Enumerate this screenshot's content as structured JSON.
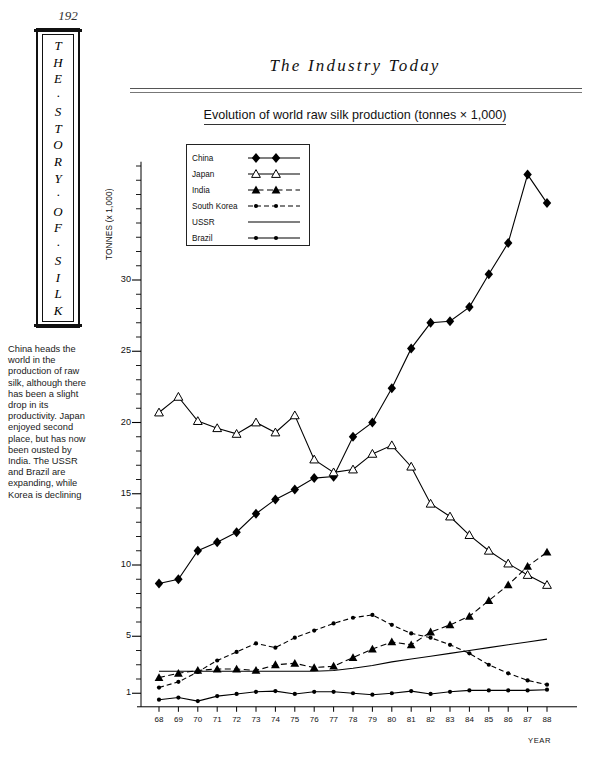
{
  "page": {
    "number": "192",
    "spine_letters": [
      "T",
      "H",
      "E",
      "·",
      "S",
      "T",
      "O",
      "R",
      "Y",
      "·",
      "O",
      "F",
      "·",
      "S",
      "I",
      "L",
      "K"
    ],
    "running_head": "The Industry Today",
    "caption": "China heads the world in the production of raw silk, although there has been a slight drop in its productivity. Japan enjoyed second place, but has now been ousted by India. The USSR and Brazil are expanding, while Korea is declining"
  },
  "chart_data": {
    "type": "line",
    "title": "Evolution of world raw silk production (tonnes × 1,000)",
    "xlabel": "YEAR",
    "ylabel": "TONNES (x 1,000)",
    "grid": false,
    "legend_position": "top-left-inside",
    "x": [
      "68",
      "69",
      "70",
      "71",
      "72",
      "73",
      "74",
      "75",
      "76",
      "77",
      "78",
      "79",
      "80",
      "81",
      "82",
      "83",
      "84",
      "85",
      "86",
      "87",
      "88"
    ],
    "xlim": [
      68,
      88
    ],
    "ylim": [
      0,
      38.5
    ],
    "yticks": [
      1,
      5,
      10,
      15,
      20,
      25,
      30
    ],
    "ytick_labels": [
      "1",
      "5",
      "10",
      "15",
      "20",
      "25",
      "30"
    ],
    "yminor_step": 1,
    "series": [
      {
        "name": "China",
        "marker": "filled-diamond",
        "line": "solid",
        "color": "#000000",
        "values": [
          8.7,
          9.0,
          11.0,
          11.6,
          12.3,
          13.6,
          14.6,
          15.3,
          16.1,
          16.2,
          19.0,
          20.0,
          22.4,
          25.2,
          27.0,
          27.1,
          28.1,
          30.4,
          32.6,
          37.4,
          35.4
        ]
      },
      {
        "name": "Japan",
        "marker": "open-triangle",
        "line": "solid",
        "color": "#000000",
        "values": [
          20.7,
          21.8,
          20.1,
          19.6,
          19.2,
          20.0,
          19.3,
          20.5,
          17.4,
          16.5,
          16.7,
          17.8,
          18.4,
          16.9,
          14.3,
          13.4,
          12.1,
          11.0,
          10.1,
          9.3,
          8.6
        ]
      },
      {
        "name": "India",
        "marker": "filled-triangle",
        "line": "dashed",
        "color": "#000000",
        "values": [
          2.1,
          2.4,
          2.6,
          2.7,
          2.7,
          2.6,
          3.0,
          3.1,
          2.8,
          2.9,
          3.5,
          4.1,
          4.6,
          4.4,
          5.3,
          5.8,
          6.4,
          7.5,
          8.6,
          9.9,
          10.9
        ]
      },
      {
        "name": "South Korea",
        "marker": "small-dot",
        "line": "dash-dot",
        "color": "#000000",
        "values": [
          1.4,
          1.8,
          2.5,
          3.3,
          3.9,
          4.5,
          4.2,
          4.9,
          5.4,
          5.9,
          6.3,
          6.5,
          5.8,
          5.2,
          4.9,
          4.4,
          3.8,
          3.0,
          2.4,
          1.9,
          1.6
        ]
      },
      {
        "name": "USSR",
        "marker": "none",
        "line": "solid",
        "color": "#000000",
        "values": [
          2.55,
          2.55,
          2.55,
          2.55,
          2.55,
          2.55,
          2.55,
          2.55,
          2.55,
          2.6,
          2.75,
          2.95,
          3.2,
          3.4,
          3.6,
          3.8,
          4.0,
          4.2,
          4.4,
          4.6,
          4.8
        ]
      },
      {
        "name": "Brazil",
        "marker": "small-dot",
        "line": "solid",
        "color": "#000000",
        "values": [
          0.55,
          0.7,
          0.45,
          0.8,
          0.95,
          1.1,
          1.15,
          0.95,
          1.1,
          1.1,
          1.0,
          0.9,
          1.0,
          1.15,
          0.95,
          1.1,
          1.2,
          1.2,
          1.2,
          1.2,
          1.25
        ]
      }
    ]
  }
}
